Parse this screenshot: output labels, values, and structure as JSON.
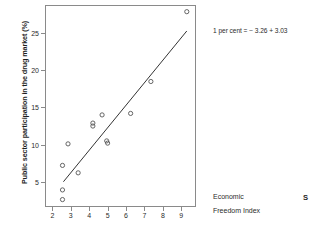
{
  "chart_data": {
    "type": "scatter",
    "title": "",
    "xlabel": "Economic Freedom Index",
    "ylabel": "Public sector participation in the drug market (%)",
    "xlim": [
      1.6,
      9.8
    ],
    "ylim": [
      1.6,
      28.8
    ],
    "xticks": [
      "2",
      "3",
      "4",
      "5",
      "6",
      "7",
      "8",
      "9"
    ],
    "xtick_values": [
      2,
      3,
      4,
      5,
      6,
      7,
      8,
      9
    ],
    "yticks": [
      "5",
      "10",
      "15",
      "20",
      "25"
    ],
    "ytick_values": [
      5,
      10,
      15,
      20,
      25
    ],
    "grid": false,
    "legend": null,
    "marker": "open-circle",
    "points": [
      {
        "x": 2.55,
        "y": 2.6
      },
      {
        "x": 2.55,
        "y": 3.9
      },
      {
        "x": 2.55,
        "y": 7.2
      },
      {
        "x": 2.85,
        "y": 10.1
      },
      {
        "x": 3.4,
        "y": 6.2
      },
      {
        "x": 4.2,
        "y": 12.9
      },
      {
        "x": 4.2,
        "y": 12.5
      },
      {
        "x": 4.7,
        "y": 14.0
      },
      {
        "x": 4.95,
        "y": 10.5
      },
      {
        "x": 5.0,
        "y": 10.2
      },
      {
        "x": 6.25,
        "y": 14.2
      },
      {
        "x": 7.35,
        "y": 18.5
      },
      {
        "x": 9.3,
        "y": 27.9
      }
    ],
    "fit_line": {
      "type": "linear-regression",
      "x_start": 2.6,
      "y_start": 5.0,
      "x_end": 9.3,
      "y_end": 25.3
    },
    "annotations": [
      {
        "name": "regression-equation",
        "text": "1 per cent =  − 3.26 + 3.03"
      }
    ],
    "xaxis_caption_lines": [
      "Economic",
      "Freedom Index"
    ],
    "source_mark": "S",
    "colors": {
      "axis": "#8a8a8a",
      "marker": "#555555",
      "line": "#333333",
      "text": "#2b2b2b",
      "background": "#ffffff"
    }
  }
}
